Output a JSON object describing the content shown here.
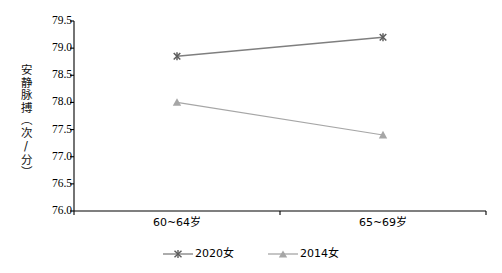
{
  "chart_data": {
    "type": "line",
    "title": "",
    "subtitle": "",
    "xlabel": "",
    "ylabel": "安静脉搏（次/分）",
    "categories": [
      "60~64岁",
      "65~69岁"
    ],
    "series": [
      {
        "name": "2020女",
        "values": [
          78.85,
          79.2
        ],
        "color": "#7f7f7f",
        "marker": "asterisk"
      },
      {
        "name": "2014女",
        "values": [
          78.0,
          77.4
        ],
        "color": "#a6a6a6",
        "marker": "triangle"
      }
    ],
    "ylim": [
      76.0,
      79.5
    ],
    "ytick_labels": [
      "76.0",
      "76.5",
      "77.0",
      "77.5",
      "78.0",
      "78.5",
      "79.0",
      "79.5"
    ],
    "ytick_values": [
      76.0,
      76.5,
      77.0,
      77.5,
      78.0,
      78.5,
      79.0,
      79.5
    ],
    "grid": false,
    "legend_position": "bottom",
    "axis_color": "#000000",
    "background_color": "#ffffff"
  },
  "legend": {
    "items": [
      {
        "label": "2020女"
      },
      {
        "label": "2014女"
      }
    ]
  }
}
